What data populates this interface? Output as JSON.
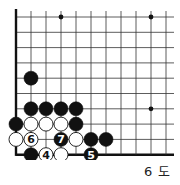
{
  "diagram": {
    "caption": "6 도",
    "board": {
      "origin_x": 16,
      "origin_y": 17,
      "col_spacing": 15,
      "row_spacing": 15.3,
      "cols": 11,
      "rows": 10,
      "right_edge_x": 174,
      "left_edge": true,
      "bottom_edge": true,
      "line_color": "#333333",
      "edge_color": "#111111"
    },
    "star_points": [
      {
        "col": 3,
        "row": 0
      },
      {
        "col": 9,
        "row": 0
      },
      {
        "col": 9,
        "row": 6
      }
    ],
    "stones": [
      {
        "col": 1,
        "row": 4,
        "color": "black",
        "label": ""
      },
      {
        "col": 1,
        "row": 6,
        "color": "black",
        "label": ""
      },
      {
        "col": 2,
        "row": 6,
        "color": "black",
        "label": ""
      },
      {
        "col": 3,
        "row": 6,
        "color": "black",
        "label": ""
      },
      {
        "col": 4,
        "row": 6,
        "color": "black",
        "label": ""
      },
      {
        "col": 0,
        "row": 7,
        "color": "black",
        "label": ""
      },
      {
        "col": 1,
        "row": 7,
        "color": "white",
        "label": ""
      },
      {
        "col": 2,
        "row": 7,
        "color": "white",
        "label": ""
      },
      {
        "col": 3,
        "row": 7,
        "color": "white",
        "label": ""
      },
      {
        "col": 4,
        "row": 7,
        "color": "black",
        "label": ""
      },
      {
        "col": 0,
        "row": 8,
        "color": "white",
        "label": ""
      },
      {
        "col": 1,
        "row": 8,
        "color": "white",
        "label": "6"
      },
      {
        "col": 3,
        "row": 8,
        "color": "black",
        "label": "7"
      },
      {
        "col": 4,
        "row": 8,
        "color": "white",
        "label": ""
      },
      {
        "col": 5,
        "row": 8,
        "color": "black",
        "label": ""
      },
      {
        "col": 6,
        "row": 8,
        "color": "black",
        "label": ""
      },
      {
        "col": 1,
        "row": 9,
        "color": "black",
        "label": ""
      },
      {
        "col": 2,
        "row": 9,
        "color": "white",
        "label": "4"
      },
      {
        "col": 3,
        "row": 9,
        "color": "white",
        "label": ""
      },
      {
        "col": 5,
        "row": 9,
        "color": "black",
        "label": "5"
      }
    ]
  }
}
